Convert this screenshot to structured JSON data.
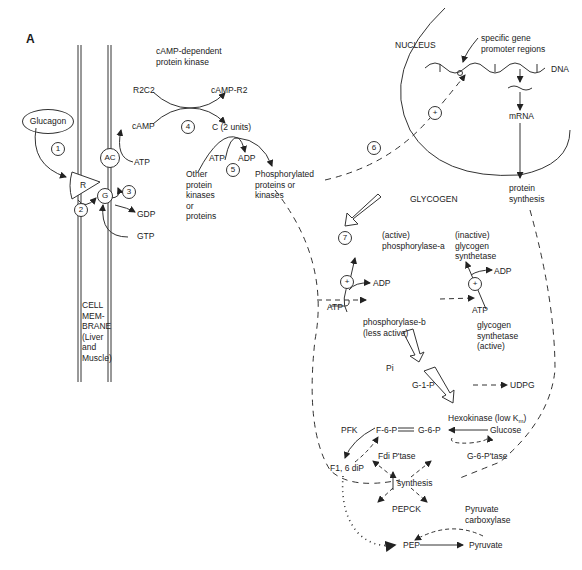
{
  "panel_label": "A",
  "membrane": {
    "ligand": "Glucagon",
    "receptor": "R",
    "g_protein": "G",
    "adenylate_cyclase": "AC",
    "gtp": "GTP",
    "gdp": "GDP",
    "atp": "ATP",
    "camp": "cAMP",
    "membrane_label": "CELL\nMEM-\nBRANE\n(Liver\nand\nMuscle)"
  },
  "pka": {
    "title": "cAMP-dependent\nprotein kinase",
    "holoenzyme": "R2C2",
    "camp_r2": "cAMP-R2",
    "catalytic": "C (2 units)"
  },
  "phosphorylation": {
    "atp": "ATP",
    "adp": "ADP",
    "substrates": "Other\nprotein\nkinases\nor\nproteins",
    "products": "Phosphorylated\nproteins or\nkinases"
  },
  "nucleus": {
    "label": "NUCLEUS",
    "promoter": "specific gene\npromoter regions",
    "dna": "DNA",
    "mrna": "mRNA",
    "protein_synthesis": "protein\nsynthesis"
  },
  "glycogen": {
    "glycogen": "GLYCOGEN",
    "phosphorylase_a": "(active)\nphosphorylase-a",
    "phosphorylase_b": "phosphorylase-b\n(less active)",
    "atp1": "ATP",
    "adp1": "ADP",
    "synthetase_inactive": "(inactive)\nglycogen\nsynthetase",
    "synthetase_active": "glycogen\nsynthetase\n(active)",
    "atp2": "ATP",
    "adp2": "ADP",
    "pi": "Pi"
  },
  "metabolism": {
    "g1p": "G-1-P",
    "udpg": "UDPG",
    "g6p": "G-6-P",
    "f6p": "F-6-P",
    "hexokinase": "Hexokinase (low Km)",
    "glucose": "Glucose",
    "pfk": "PFK",
    "fdi_ptase": "Fdi P'tase",
    "g6_ptase": "G-6-P'tase",
    "f16dip": "F1, 6 diP",
    "synthesis": "synthesis",
    "pepck": "PEPCK",
    "pyruvate_carboxylase": "Pyruvate\ncarboxylase",
    "pep": "PEP",
    "pyruvate": "Pyruvate"
  },
  "step_numbers": [
    "1",
    "2",
    "3",
    "4",
    "5",
    "6",
    "7"
  ],
  "stimulation_sign": "+"
}
